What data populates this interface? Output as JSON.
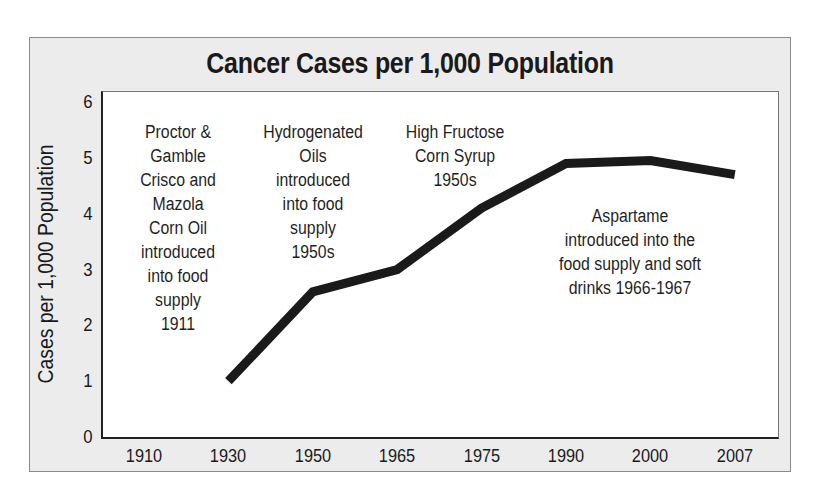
{
  "chart_data": {
    "type": "line",
    "title": "Cancer Cases per 1,000 Population",
    "xlabel": "",
    "ylabel": "Cases per 1,000 Population",
    "ylim": [
      0,
      6
    ],
    "yticks": [
      "0",
      "1",
      "2",
      "3",
      "4",
      "5",
      "6"
    ],
    "categories": [
      "1910",
      "1930",
      "1950",
      "1965",
      "1975",
      "1990",
      "2000",
      "2007"
    ],
    "series": [
      {
        "name": "Cancer cases per 1,000",
        "values": [
          null,
          1.0,
          2.6,
          3.0,
          4.1,
          4.9,
          4.95,
          4.7
        ],
        "color": "#1a1a1a"
      }
    ],
    "grid": false,
    "legend": null,
    "annotations": [
      {
        "lines": [
          "Proctor &",
          "Gamble",
          "Crisco and",
          "Mazola",
          "Corn Oil",
          "introduced",
          "into food",
          "supply",
          "1911"
        ]
      },
      {
        "lines": [
          "Hydrogenated",
          "Oils",
          "introduced",
          "into food",
          "supply",
          "1950s"
        ]
      },
      {
        "lines": [
          "High Fructose",
          "Corn Syrup",
          "1950s"
        ]
      },
      {
        "lines": [
          "Aspartame",
          "introduced into the",
          "food supply and soft",
          "drinks 1966-1967"
        ]
      }
    ]
  },
  "colors": {
    "frame_bg": "#ececec",
    "plot_bg": "#ffffff",
    "line": "#1a1a1a",
    "text": "#1a1a1a"
  }
}
